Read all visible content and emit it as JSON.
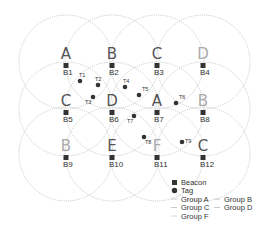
{
  "diagram": {
    "title": "",
    "colors": {
      "circle": "#b9b9b9",
      "beacon": "#333333",
      "tag": "#333333",
      "letter_dark": "#555555",
      "letter_light": "#aaaaaa"
    },
    "beacons": [
      {
        "id": "B1",
        "group": "A",
        "x": 66,
        "y": 66
      },
      {
        "id": "B2",
        "group": "B",
        "x": 112,
        "y": 66
      },
      {
        "id": "B3",
        "group": "C",
        "x": 157,
        "y": 66
      },
      {
        "id": "B4",
        "group": "D",
        "x": 203,
        "y": 66
      },
      {
        "id": "B5",
        "group": "C",
        "x": 66,
        "y": 113
      },
      {
        "id": "B6",
        "group": "D",
        "x": 112,
        "y": 113
      },
      {
        "id": "B7",
        "group": "A",
        "x": 157,
        "y": 113
      },
      {
        "id": "B8",
        "group": "B",
        "x": 203,
        "y": 113
      },
      {
        "id": "B9",
        "group": "B",
        "x": 66,
        "y": 158
      },
      {
        "id": "B10",
        "group": "E",
        "x": 112,
        "y": 158
      },
      {
        "id": "B11",
        "group": "F",
        "x": 157,
        "y": 158
      },
      {
        "id": "B12",
        "group": "C",
        "x": 203,
        "y": 158
      }
    ],
    "tags": [
      {
        "id": "T1",
        "x": 80,
        "y": 81
      },
      {
        "id": "T2",
        "x": 98,
        "y": 85
      },
      {
        "id": "T3",
        "x": 93,
        "y": 97
      },
      {
        "id": "T4",
        "x": 125,
        "y": 87
      },
      {
        "id": "T5",
        "x": 139,
        "y": 95
      },
      {
        "id": "T6",
        "x": 176,
        "y": 103
      },
      {
        "id": "T7",
        "x": 134,
        "y": 116
      },
      {
        "id": "T8",
        "x": 144,
        "y": 137
      },
      {
        "id": "T9",
        "x": 182,
        "y": 142
      }
    ],
    "circle_radius": 47,
    "legend": {
      "beacon": "Beacon",
      "tag": "Tag",
      "groups": [
        "Group A",
        "Group B",
        "Group C",
        "Group D",
        "Group F"
      ]
    }
  }
}
